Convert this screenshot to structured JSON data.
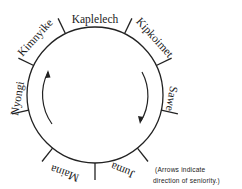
{
  "diagram": {
    "type": "circular-cycle",
    "center": [
      95,
      95
    ],
    "radius": 68,
    "stroke_color": "#222222",
    "segments": [
      {
        "label": "Kaplelech"
      },
      {
        "label": "Kipkoimet"
      },
      {
        "label": "Sawe"
      },
      {
        "label": "Juma"
      },
      {
        "label": "Maina"
      },
      {
        "label": "Nyongi"
      },
      {
        "label": "Kimnyike"
      }
    ],
    "arrows": {
      "left": {
        "direction": "up"
      },
      "right": {
        "direction": "down"
      }
    },
    "note": {
      "line1": "(Arrows indicate",
      "line2": "direction of seniority.)"
    }
  }
}
